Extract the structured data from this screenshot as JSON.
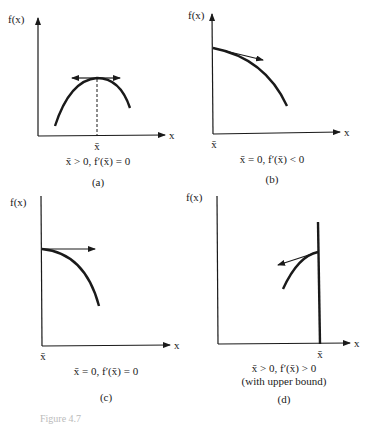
{
  "panels": [
    {
      "id": "a",
      "y_axis_label": "f(x)",
      "x_axis_label": "x",
      "point_label": "x̄",
      "condition": "x̄ > 0, f′(x̄) = 0",
      "panel_label": "(a)",
      "description": "Interior maximum with horizontal tangent"
    },
    {
      "id": "b",
      "y_axis_label": "f(x)",
      "x_axis_label": "x",
      "point_label": "x̄",
      "condition": "x̄ = 0, f′(x̄) < 0",
      "panel_label": "(b)",
      "description": "Corner maximum at zero with negative slope"
    },
    {
      "id": "c",
      "y_axis_label": "f(x)",
      "x_axis_label": "x",
      "point_label": "x̄",
      "condition": "x̄ = 0, f′(x̄) = 0",
      "panel_label": "(c)",
      "description": "Maximum at zero with zero slope"
    },
    {
      "id": "d",
      "y_axis_label": "f(x)",
      "x_axis_label": "x",
      "point_label": "x̄",
      "condition": "x̄ > 0, f′(x̄) > 0",
      "condition_note": "(with upper bound)",
      "panel_label": "(d)",
      "description": "Maximum at upper bound with positive slope"
    }
  ],
  "figure_caption_partial": "Figure 4.7"
}
